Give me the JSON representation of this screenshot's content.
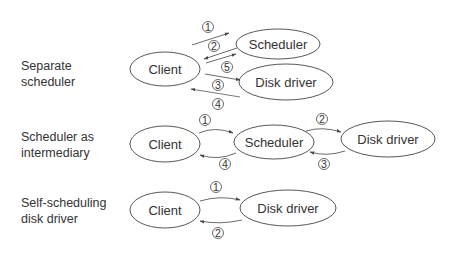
{
  "sections": [
    {
      "label_line1": "Separate",
      "label_line2": "scheduler",
      "nodes": {
        "client": "Client",
        "scheduler": "Scheduler",
        "disk_driver": "Disk driver"
      },
      "steps": [
        "1",
        "2",
        "5",
        "3",
        "4"
      ]
    },
    {
      "label_line1": "Scheduler as",
      "label_line2": "intermediary",
      "nodes": {
        "client": "Client",
        "scheduler": "Scheduler",
        "disk_driver": "Disk driver"
      },
      "steps": [
        "1",
        "2",
        "3",
        "4"
      ]
    },
    {
      "label_line1": "Self-scheduling",
      "label_line2": "disk driver",
      "nodes": {
        "client": "Client",
        "disk_driver": "Disk driver"
      },
      "steps": [
        "1",
        "2"
      ]
    }
  ],
  "colors": {
    "line": "#444444",
    "accent_line": "#c0504d"
  }
}
